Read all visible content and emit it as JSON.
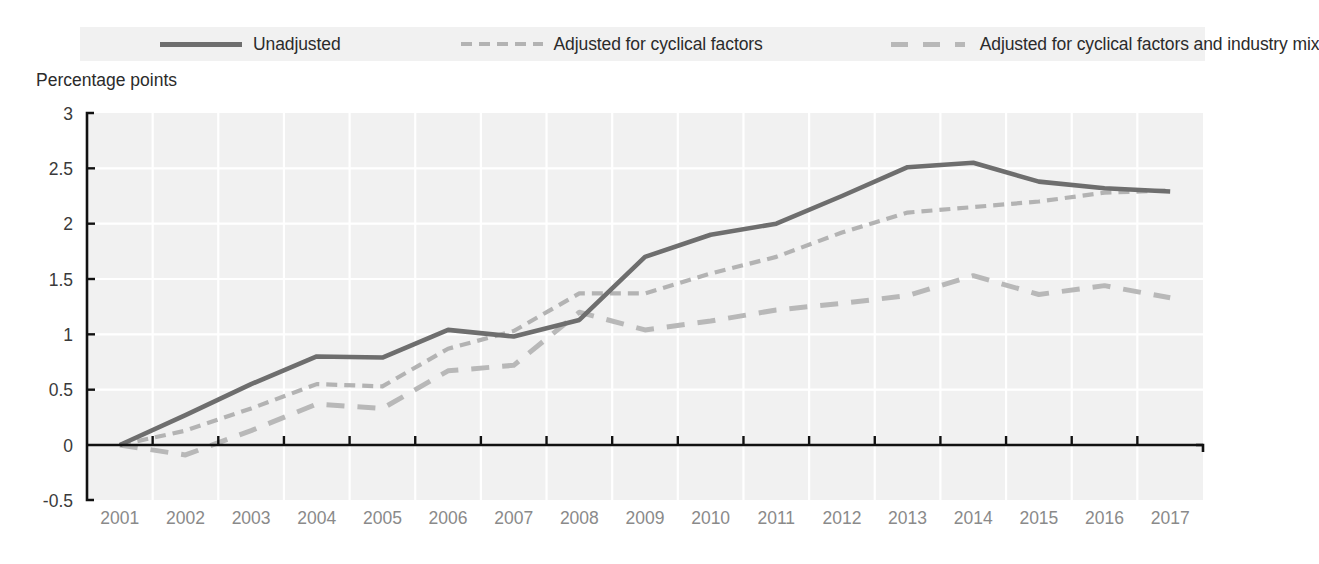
{
  "legend": {
    "position": "top",
    "items": [
      {
        "label": "Unadjusted",
        "style": "solid",
        "color": "#6e6e6e",
        "swatch_icon": "solid-line-icon"
      },
      {
        "label": "Adjusted for cyclical factors",
        "style": "dash-fine",
        "color": "#b3b3b3",
        "swatch_icon": "fine-dashed-line-icon"
      },
      {
        "label": "Adjusted for cyclical factors and industry mix",
        "style": "dash-coarse",
        "color": "#b8b8b8",
        "swatch_icon": "coarse-dashed-line-icon"
      }
    ]
  },
  "axis_title": "Percentage points",
  "chart_data": {
    "type": "line",
    "title": "",
    "subtitle": "",
    "xlabel": "",
    "ylabel": "Percentage points",
    "ylim": [
      -0.5,
      3
    ],
    "xlim": [
      "2001",
      "2017"
    ],
    "grid": true,
    "legend_position": "top",
    "ytick_labels": [
      "3",
      "2.5",
      "2",
      "1.5",
      "1",
      "0.5",
      "0",
      "-0.5"
    ],
    "ytick_values": [
      3,
      2.5,
      2,
      1.5,
      1,
      0.5,
      0,
      -0.5
    ],
    "categories": [
      "2001",
      "2002",
      "2003",
      "2004",
      "2005",
      "2006",
      "2007",
      "2008",
      "2009",
      "2010",
      "2011",
      "2012",
      "2013",
      "2014",
      "2015",
      "2016",
      "2017"
    ],
    "x": [
      2001,
      2002,
      2003,
      2004,
      2005,
      2006,
      2007,
      2008,
      2009,
      2010,
      2011,
      2012,
      2013,
      2014,
      2015,
      2016,
      2017
    ],
    "series": [
      {
        "name": "Unadjusted",
        "color": "#6e6e6e",
        "style": "solid",
        "values": [
          0,
          0.27,
          0.55,
          0.8,
          0.79,
          1.04,
          0.98,
          1.13,
          1.7,
          1.9,
          2.0,
          2.25,
          2.51,
          2.55,
          2.38,
          2.32,
          2.29
        ]
      },
      {
        "name": "Adjusted for cyclical factors",
        "color": "#b3b3b3",
        "style": "dash-fine",
        "values": [
          0,
          0.13,
          0.33,
          0.55,
          0.53,
          0.87,
          1.03,
          1.37,
          1.37,
          1.55,
          1.7,
          1.92,
          2.1,
          2.15,
          2.2,
          2.28,
          2.3
        ]
      },
      {
        "name": "Adjusted for cyclical factors and industry mix",
        "color": "#b8b8b8",
        "style": "dash-coarse",
        "values": [
          0,
          -0.09,
          0.13,
          0.37,
          0.33,
          0.67,
          0.72,
          1.2,
          1.04,
          1.12,
          1.22,
          1.28,
          1.35,
          1.53,
          1.36,
          1.44,
          1.33
        ]
      }
    ]
  },
  "colors": {
    "plot_background": "#f1f1f1",
    "gridline": "#ffffff",
    "axis": "#111111",
    "xtick_text": "#8a8a8a",
    "ytick_text": "#3a3a3a"
  }
}
